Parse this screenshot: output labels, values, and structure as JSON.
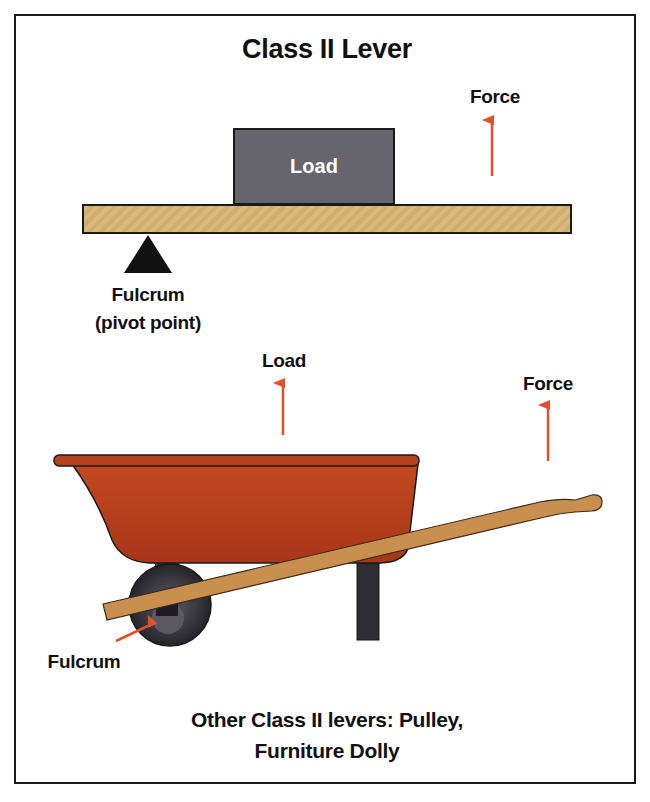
{
  "title": "Class II Lever",
  "top_diagram": {
    "load_label": "Load",
    "force_label": "Force",
    "fulcrum_label_line1": "Fulcrum",
    "fulcrum_label_line2": "(pivot point)"
  },
  "wheelbarrow_diagram": {
    "load_label": "Load",
    "force_label": "Force",
    "fulcrum_label": "Fulcrum"
  },
  "caption": {
    "line1": "Other Class II levers: Pulley,",
    "line2": "Furniture Dolly"
  },
  "colors": {
    "arrow": "#e0502a",
    "plank": "#d9b97c",
    "load_box": "#66656e",
    "tub": "#b8401a",
    "handle": "#c98f4e",
    "wheel": "#2e2c33",
    "border": "#1a1a1a"
  }
}
